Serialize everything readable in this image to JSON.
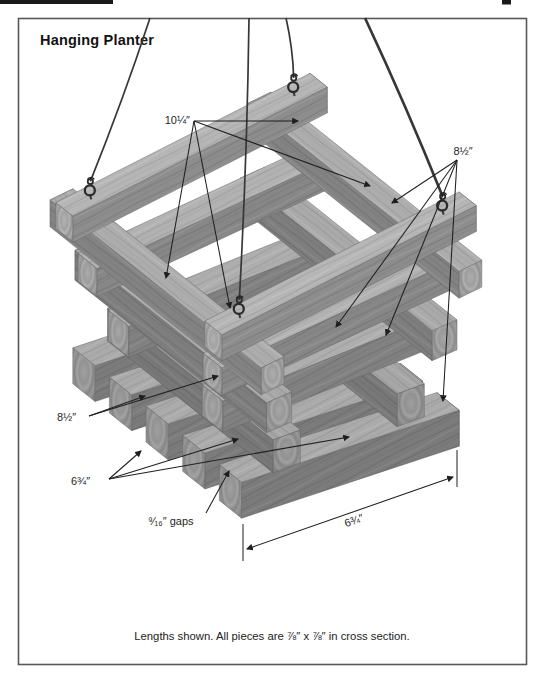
{
  "title": "Hanging Planter",
  "caption": "Lengths shown. All pieces are ⅞″ x ⅞″ in cross section.",
  "colors": {
    "wood_top": "#b6b6b6",
    "wood_side": "#8d8d8d",
    "wood_end": "#a5a5a5",
    "annotation": "#1f1f1f",
    "wire": "#373737",
    "frame": "#57585a",
    "crop_bar": "#191919",
    "background": "#ffffff"
  },
  "callouts": [
    {
      "id": "length-10-1-4",
      "text": "10¼″",
      "tx": 190,
      "ty": 124,
      "anchor": "end",
      "origin": [
        194,
        121
      ],
      "tips": [
        [
          298,
          121
        ],
        [
          370,
          186
        ],
        [
          166,
          278
        ],
        [
          230,
          308
        ]
      ]
    },
    {
      "id": "length-8-1-2-right",
      "text": "8½″",
      "tx": 463,
      "ty": 155,
      "anchor": "middle",
      "origin": [
        457,
        160
      ],
      "tips": [
        [
          392,
          203
        ],
        [
          336,
          327
        ],
        [
          386,
          335
        ],
        [
          443,
          401
        ]
      ]
    },
    {
      "id": "length-8-1-2-left",
      "text": "8½″",
      "tx": 57,
      "ty": 421,
      "anchor": "start",
      "origin": [
        89,
        416
      ],
      "tips": [
        [
          145,
          396
        ],
        [
          218,
          376
        ]
      ]
    },
    {
      "id": "length-6-3-4-left",
      "text": "6¾″",
      "tx": 71,
      "ty": 485,
      "anchor": "start",
      "origin": [
        109,
        479
      ],
      "tips": [
        [
          141,
          451
        ],
        [
          238,
          439
        ],
        [
          349,
          437
        ]
      ]
    },
    {
      "id": "gap-9-16",
      "text": "⁹⁄₁₆″ gaps",
      "tx": 148,
      "ty": 525,
      "anchor": "start",
      "origin": [
        206,
        513
      ],
      "tips": [
        [
          229,
          471
        ]
      ]
    }
  ],
  "dimension_line": {
    "text": "6¾″"
  },
  "hardware": {
    "screw_eyes": 4,
    "wires": 4
  }
}
